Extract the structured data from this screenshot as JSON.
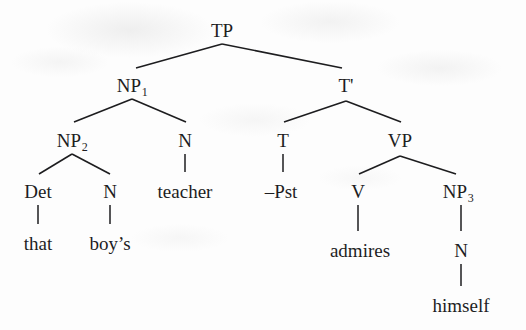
{
  "diagram": {
    "type": "syntax-tree",
    "sentence": "that boy's teacher -Pst admires himself",
    "ink_color": "#1d1d1f",
    "background_color": "#fdfdfd",
    "nodes": [
      {
        "id": "TP",
        "label": "TP",
        "sub": "",
        "x": 222,
        "y": 30
      },
      {
        "id": "NP1",
        "label": "NP",
        "sub": "1",
        "x": 132,
        "y": 85
      },
      {
        "id": "Tbar",
        "label": "T'",
        "sub": "",
        "x": 346,
        "y": 85
      },
      {
        "id": "NP2",
        "label": "NP",
        "sub": "2",
        "x": 72,
        "y": 140
      },
      {
        "id": "N1",
        "label": "N",
        "sub": "",
        "x": 185,
        "y": 140
      },
      {
        "id": "T",
        "label": "T",
        "sub": "",
        "x": 283,
        "y": 140
      },
      {
        "id": "VP",
        "label": "VP",
        "sub": "",
        "x": 400,
        "y": 140
      },
      {
        "id": "Det",
        "label": "Det",
        "sub": "",
        "x": 38,
        "y": 191
      },
      {
        "id": "N2",
        "label": "N",
        "sub": "",
        "x": 110,
        "y": 191
      },
      {
        "id": "V",
        "label": "V",
        "sub": "",
        "x": 358,
        "y": 191
      },
      {
        "id": "NP3",
        "label": "NP",
        "sub": "3",
        "x": 458,
        "y": 191
      },
      {
        "id": "N3",
        "label": "N",
        "sub": "",
        "x": 461,
        "y": 250
      }
    ],
    "leaves": [
      {
        "id": "w-teacher",
        "text": "teacher",
        "x": 185,
        "y": 191,
        "parent": "N1"
      },
      {
        "id": "w-pst",
        "text": "–Pst",
        "x": 281,
        "y": 191,
        "parent": "T"
      },
      {
        "id": "w-that",
        "text": "that",
        "x": 38,
        "y": 243,
        "parent": "Det"
      },
      {
        "id": "w-boys",
        "text": "boy’s",
        "x": 110,
        "y": 243,
        "parent": "N2"
      },
      {
        "id": "w-admires",
        "text": "admires",
        "x": 360,
        "y": 250,
        "parent": "V"
      },
      {
        "id": "w-himself",
        "text": "himself",
        "x": 461,
        "y": 305,
        "parent": "N3"
      }
    ],
    "edges": [
      {
        "from": "TP",
        "to": "NP1",
        "x1": 222,
        "y1": 44,
        "x2": 136,
        "y2": 68,
        "kind": "branch"
      },
      {
        "from": "TP",
        "to": "Tbar",
        "x1": 222,
        "y1": 44,
        "x2": 342,
        "y2": 68,
        "kind": "branch"
      },
      {
        "from": "NP1",
        "to": "NP2",
        "x1": 132,
        "y1": 99,
        "x2": 74,
        "y2": 122,
        "kind": "branch"
      },
      {
        "from": "NP1",
        "to": "N1",
        "x1": 132,
        "y1": 99,
        "x2": 186,
        "y2": 122,
        "kind": "branch"
      },
      {
        "from": "Tbar",
        "to": "T",
        "x1": 346,
        "y1": 101,
        "x2": 284,
        "y2": 122,
        "kind": "branch"
      },
      {
        "from": "Tbar",
        "to": "VP",
        "x1": 346,
        "y1": 101,
        "x2": 401,
        "y2": 122,
        "kind": "branch"
      },
      {
        "from": "NP2",
        "to": "Det",
        "x1": 72,
        "y1": 154,
        "x2": 39,
        "y2": 174,
        "kind": "branch"
      },
      {
        "from": "NP2",
        "to": "N2",
        "x1": 72,
        "y1": 154,
        "x2": 110,
        "y2": 174,
        "kind": "branch"
      },
      {
        "from": "VP",
        "to": "V",
        "x1": 400,
        "y1": 156,
        "x2": 359,
        "y2": 174,
        "kind": "branch"
      },
      {
        "from": "VP",
        "to": "NP3",
        "x1": 400,
        "y1": 156,
        "x2": 456,
        "y2": 174,
        "kind": "branch"
      },
      {
        "from": "N1",
        "to": "w-teacher",
        "x1": 185,
        "y1": 154,
        "x2": 185,
        "y2": 172,
        "kind": "stem"
      },
      {
        "from": "T",
        "to": "w-pst",
        "x1": 283,
        "y1": 154,
        "x2": 283,
        "y2": 172,
        "kind": "stem"
      },
      {
        "from": "Det",
        "to": "w-that",
        "x1": 38,
        "y1": 205,
        "x2": 38,
        "y2": 224,
        "kind": "stem"
      },
      {
        "from": "N2",
        "to": "w-boys",
        "x1": 110,
        "y1": 205,
        "x2": 110,
        "y2": 224,
        "kind": "stem"
      },
      {
        "from": "V",
        "to": "w-admires",
        "x1": 358,
        "y1": 205,
        "x2": 358,
        "y2": 231,
        "kind": "stem"
      },
      {
        "from": "NP3",
        "to": "N3",
        "x1": 461,
        "y1": 205,
        "x2": 461,
        "y2": 231,
        "kind": "stem"
      },
      {
        "from": "N3",
        "to": "w-himself",
        "x1": 461,
        "y1": 264,
        "x2": 461,
        "y2": 286,
        "kind": "stem"
      }
    ]
  }
}
